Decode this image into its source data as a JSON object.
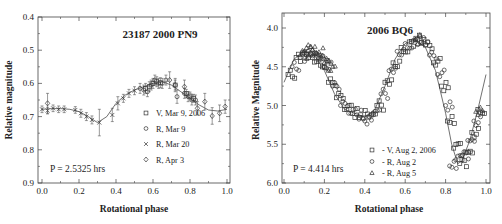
{
  "chart_data": [
    {
      "type": "scatter",
      "title": "23187 2000 PN9",
      "xlabel": "Rotational phase",
      "ylabel": "Relative magnitude",
      "xlim": [
        0.0,
        1.0
      ],
      "ylim": [
        0.4,
        0.9
      ],
      "y_inverted": true,
      "x_ticks": [
        "0.0",
        "0.2",
        "0.4",
        "0.6",
        "0.8",
        "1.0"
      ],
      "y_ticks": [
        "0.4",
        "0.5",
        "0.6",
        "0.7",
        "0.8",
        "0.9"
      ],
      "grid": false,
      "annotation": "P = 2.5325 hrs",
      "legend_position": "lower right",
      "legend": [
        {
          "marker": "square",
          "label": "V, Mar 9, 2006"
        },
        {
          "marker": "circle",
          "label": "R, Mar 9"
        },
        {
          "marker": "cross",
          "label": "R, Mar 20"
        },
        {
          "marker": "diamond",
          "label": "R, Apr 3"
        }
      ],
      "fit_curve": {
        "x": [
          0.0,
          0.05,
          0.1,
          0.15,
          0.2,
          0.25,
          0.3,
          0.35,
          0.4,
          0.45,
          0.5,
          0.55,
          0.6,
          0.65,
          0.7,
          0.75,
          0.8,
          0.85,
          0.9,
          0.95,
          1.0
        ],
        "y": [
          0.678,
          0.676,
          0.676,
          0.678,
          0.685,
          0.7,
          0.718,
          0.7,
          0.66,
          0.635,
          0.62,
          0.61,
          0.6,
          0.595,
          0.605,
          0.625,
          0.645,
          0.665,
          0.68,
          0.683,
          0.678
        ]
      },
      "series": [
        {
          "name": "V, Mar 9, 2006",
          "marker": "square",
          "x": [
            0.56,
            0.58,
            0.6,
            0.62,
            0.64,
            0.72,
            0.78,
            0.8,
            0.82
          ],
          "y": [
            0.615,
            0.61,
            0.6,
            0.595,
            0.598,
            0.605,
            0.63,
            0.638,
            0.645
          ],
          "err": [
            0.015,
            0.015,
            0.015,
            0.015,
            0.015,
            0.015,
            0.012,
            0.012,
            0.012
          ]
        },
        {
          "name": "R, Mar 9",
          "marker": "circle",
          "x": [
            0.53,
            0.55,
            0.57,
            0.59,
            0.61,
            0.63,
            0.65,
            0.67,
            0.73,
            0.77,
            0.79,
            0.81,
            0.83
          ],
          "y": [
            0.615,
            0.62,
            0.625,
            0.605,
            0.59,
            0.6,
            0.6,
            0.59,
            0.64,
            0.63,
            0.64,
            0.65,
            0.65
          ],
          "err": [
            0.015,
            0.015,
            0.015,
            0.015,
            0.015,
            0.015,
            0.015,
            0.015,
            0.02,
            0.015,
            0.015,
            0.015,
            0.015
          ]
        },
        {
          "name": "R, Mar 20",
          "marker": "cross",
          "x": [
            0.0,
            0.03,
            0.06,
            0.09,
            0.12,
            0.18,
            0.21,
            0.24,
            0.27,
            0.31,
            0.38,
            0.41,
            0.44,
            0.47,
            0.5
          ],
          "y": [
            0.678,
            0.682,
            0.675,
            0.678,
            0.678,
            0.68,
            0.69,
            0.7,
            0.71,
            0.718,
            0.695,
            0.66,
            0.645,
            0.63,
            0.622
          ],
          "err": [
            0.01,
            0.01,
            0.01,
            0.01,
            0.01,
            0.01,
            0.012,
            0.012,
            0.012,
            0.04,
            0.02,
            0.02,
            0.012,
            0.012,
            0.012
          ]
        },
        {
          "name": "R, Apr 3",
          "marker": "diamond",
          "x": [
            0.03,
            0.69,
            0.72,
            0.77,
            0.84,
            0.88,
            0.92,
            0.96,
            0.99
          ],
          "y": [
            0.66,
            0.59,
            0.605,
            0.61,
            0.675,
            0.655,
            0.698,
            0.69,
            0.67
          ],
          "err": [
            0.03,
            0.025,
            0.02,
            0.02,
            0.02,
            0.025,
            0.025,
            0.025,
            0.02
          ]
        }
      ]
    },
    {
      "type": "scatter",
      "title": "2006 BQ6",
      "xlabel": "Rotational phase",
      "ylabel": "Relative Magnitude",
      "xlim": [
        0.0,
        1.0
      ],
      "ylim": [
        3.8,
        6.0
      ],
      "y_inverted": true,
      "x_ticks": [
        "0.0",
        "0.2",
        "0.4",
        "0.6",
        "0.8",
        "1.0"
      ],
      "y_ticks": [
        "4.0",
        "4.5",
        "5.0",
        "5.5",
        "6.0"
      ],
      "grid": false,
      "annotation": "P = 4.414 hrs",
      "legend_position": "lower center",
      "legend": [
        {
          "marker": "square",
          "label": "- V, Aug 2, 2006"
        },
        {
          "marker": "circle",
          "label": "- R, Aug 2"
        },
        {
          "marker": "triangle",
          "label": "- R, Aug 5"
        }
      ],
      "fit_curve": {
        "x": [
          0.0,
          0.05,
          0.1,
          0.15,
          0.2,
          0.25,
          0.3,
          0.35,
          0.4,
          0.45,
          0.5,
          0.55,
          0.6,
          0.65,
          0.7,
          0.75,
          0.8,
          0.83,
          0.86,
          0.88,
          0.92,
          0.96,
          1.0
        ],
        "y": [
          4.7,
          4.4,
          4.3,
          4.35,
          4.55,
          4.85,
          5.05,
          5.1,
          5.15,
          5.05,
          4.75,
          4.4,
          4.2,
          4.15,
          4.25,
          4.55,
          5.1,
          5.5,
          5.75,
          5.72,
          5.45,
          5.05,
          4.6
        ]
      },
      "series": [
        {
          "name": "- V, Aug 2, 2006",
          "marker": "square",
          "x": [
            0.02,
            0.06,
            0.1,
            0.14,
            0.18,
            0.22,
            0.26,
            0.3,
            0.34,
            0.38,
            0.42,
            0.46,
            0.5,
            0.54,
            0.58,
            0.62,
            0.66,
            0.7,
            0.74,
            0.78,
            0.81,
            0.84,
            0.87,
            0.9,
            0.93,
            0.96
          ],
          "y": [
            4.6,
            4.38,
            4.32,
            4.38,
            4.48,
            4.7,
            4.9,
            5.05,
            5.1,
            5.12,
            5.15,
            5.0,
            4.7,
            4.45,
            4.25,
            4.18,
            4.15,
            4.22,
            4.45,
            4.75,
            5.2,
            5.55,
            5.75,
            5.6,
            5.35,
            5.05
          ]
        },
        {
          "name": "- R, Aug 2",
          "marker": "circle",
          "x": [
            0.04,
            0.08,
            0.12,
            0.16,
            0.2,
            0.24,
            0.28,
            0.32,
            0.36,
            0.4,
            0.44,
            0.48,
            0.52,
            0.56,
            0.6,
            0.64,
            0.68,
            0.72,
            0.76,
            0.8,
            0.82,
            0.85,
            0.88,
            0.91,
            0.94
          ],
          "y": [
            4.5,
            4.38,
            4.3,
            4.33,
            4.5,
            4.75,
            5.0,
            5.1,
            5.12,
            5.2,
            5.1,
            4.85,
            4.55,
            4.3,
            4.2,
            4.16,
            4.18,
            4.35,
            4.6,
            5.0,
            5.78,
            5.7,
            5.65,
            5.45,
            5.2
          ]
        },
        {
          "name": "- R, Aug 5",
          "marker": "triangle",
          "x": [
            0.08,
            0.1,
            0.12,
            0.14,
            0.16,
            0.18,
            0.2,
            0.22,
            0.65,
            0.95
          ],
          "y": [
            4.35,
            4.3,
            4.22,
            4.28,
            4.32,
            4.4,
            4.45,
            4.55,
            4.15,
            5.08
          ]
        }
      ]
    }
  ]
}
